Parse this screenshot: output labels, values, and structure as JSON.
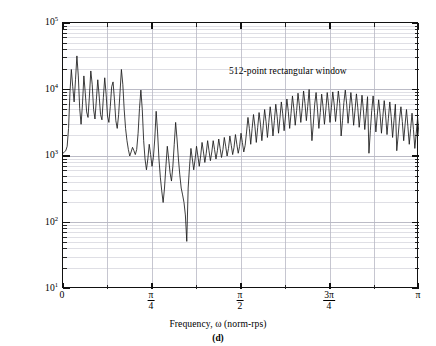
{
  "chart_data": {
    "type": "line",
    "title": "",
    "subcaption": "(d)",
    "annotation": "512-point rectangular window",
    "xlabel": "Frequency, ω  (norm-rps)",
    "ylabel": "Short-term magnitude spectrum, |S(ω;2012)|",
    "xscale": "linear",
    "yscale": "log",
    "xlim": [
      0,
      3.141592653589793
    ],
    "ylim": [
      10,
      100000
    ],
    "grid": "major-and-minor",
    "legend": "none",
    "line_color": "#1a1a1a",
    "grid_color": "#c8c8d0",
    "axis_color": "#111111",
    "xticks": [
      {
        "value": 0,
        "label_num": "0",
        "label_den": ""
      },
      {
        "value": 0.785398,
        "label_num": "π",
        "label_den": "4"
      },
      {
        "value": 1.570796,
        "label_num": "π",
        "label_den": "2"
      },
      {
        "value": 2.356194,
        "label_num": "3π",
        "label_den": "4"
      },
      {
        "value": 3.141593,
        "label_num": "π",
        "label_den": ""
      }
    ],
    "yticks": [
      {
        "value": 100000,
        "mantissa": "10",
        "exponent": "5"
      },
      {
        "value": 10000,
        "mantissa": "10",
        "exponent": "4"
      },
      {
        "value": 1000,
        "mantissa": "10",
        "exponent": "3"
      },
      {
        "value": 100,
        "mantissa": "10",
        "exponent": "2"
      },
      {
        "value": 10,
        "mantissa": "10",
        "exponent": "1"
      }
    ],
    "x": [
      0,
      0.0123,
      0.0245,
      0.0368,
      0.0491,
      0.0614,
      0.0736,
      0.0859,
      0.0982,
      0.1104,
      0.1227,
      0.135,
      0.1473,
      0.1595,
      0.1718,
      0.1841,
      0.1963,
      0.2086,
      0.2209,
      0.2332,
      0.2454,
      0.2577,
      0.27,
      0.2822,
      0.2945,
      0.3068,
      0.3191,
      0.3313,
      0.3436,
      0.3559,
      0.3682,
      0.3804,
      0.3927,
      0.405,
      0.4172,
      0.4295,
      0.4418,
      0.4541,
      0.4663,
      0.4786,
      0.4909,
      0.5031,
      0.5154,
      0.5277,
      0.54,
      0.5522,
      0.5645,
      0.5768,
      0.589,
      0.6013,
      0.6136,
      0.6259,
      0.6381,
      0.6504,
      0.6627,
      0.675,
      0.6872,
      0.6995,
      0.7118,
      0.724,
      0.7363,
      0.7486,
      0.7609,
      0.7731,
      0.7854,
      0.7977,
      0.8099,
      0.8222,
      0.8345,
      0.8468,
      0.859,
      0.8713,
      0.8836,
      0.8958,
      0.9081,
      0.9204,
      0.9327,
      0.9449,
      0.9572,
      0.9695,
      0.9817,
      0.994,
      1.0063,
      1.0186,
      1.0308,
      1.0431,
      1.0554,
      1.0677,
      1.0799,
      1.0922,
      1.1045,
      1.1167,
      1.129,
      1.1413,
      1.1536,
      1.1658,
      1.1781,
      1.1904,
      1.2026,
      1.2149,
      1.2272,
      1.2395,
      1.2517,
      1.264,
      1.2763,
      1.2885,
      1.3008,
      1.3131,
      1.3254,
      1.3376,
      1.3499,
      1.3622,
      1.3744,
      1.3867,
      1.399,
      1.4113,
      1.4235,
      1.4358,
      1.4481,
      1.4604,
      1.4726,
      1.4849,
      1.4972,
      1.5094,
      1.5217,
      1.534,
      1.5463,
      1.5585,
      1.5708,
      1.5831,
      1.5953,
      1.6076,
      1.6199,
      1.6322,
      1.6444,
      1.6567,
      1.669,
      1.6812,
      1.6935,
      1.7058,
      1.7181,
      1.7303,
      1.7426,
      1.7549,
      1.7671,
      1.7794,
      1.7917,
      1.804,
      1.8162,
      1.8285,
      1.8408,
      1.853,
      1.8653,
      1.8776,
      1.8899,
      1.9021,
      1.9144,
      1.9267,
      1.939,
      1.9512,
      1.9635,
      1.9758,
      1.988,
      2.0003,
      2.0126,
      2.0249,
      2.0371,
      2.0494,
      2.0617,
      2.0739,
      2.0862,
      2.0985,
      2.1108,
      2.123,
      2.1353,
      2.1476,
      2.1598,
      2.1721,
      2.1844,
      2.1967,
      2.2089,
      2.2212,
      2.2335,
      2.2458,
      2.258,
      2.2703,
      2.2826,
      2.2948,
      2.3071,
      2.3194,
      2.3317,
      2.3439,
      2.3562,
      2.3685,
      2.3807,
      2.393,
      2.4053,
      2.4176,
      2.4298,
      2.4421,
      2.4544,
      2.4666,
      2.4789,
      2.4912,
      2.5035,
      2.5157,
      2.528,
      2.5403,
      2.5525,
      2.5648,
      2.5771,
      2.5894,
      2.6016,
      2.6139,
      2.6262,
      2.6385,
      2.6507,
      2.663,
      2.6753,
      2.6875,
      2.6998,
      2.7121,
      2.7244,
      2.7366,
      2.7489,
      2.7612,
      2.7734,
      2.7857,
      2.798,
      2.8103,
      2.8225,
      2.8348,
      2.8471,
      2.8593,
      2.8716,
      2.8839,
      2.8962,
      2.9084,
      2.9207,
      2.933,
      2.9452,
      2.9575,
      2.9698,
      2.9821,
      2.9943,
      3.0066,
      3.0189,
      3.0312,
      3.0434,
      3.0557,
      3.068,
      3.0802,
      3.0925,
      3.1048,
      3.1171,
      3.1293,
      3.1416
    ],
    "y": [
      1100,
      1150,
      1200,
      1400,
      2600,
      9000,
      20000,
      11000,
      6500,
      14000,
      32000,
      16000,
      5200,
      3000,
      6000,
      16000,
      9000,
      4600,
      3800,
      8000,
      19000,
      12000,
      5000,
      3600,
      7000,
      14000,
      8000,
      4200,
      3500,
      7500,
      15000,
      8500,
      4000,
      3200,
      5500,
      11000,
      13000,
      7000,
      3400,
      2600,
      4200,
      9000,
      20000,
      12000,
      5000,
      2600,
      1700,
      1250,
      1000,
      1150,
      1350,
      1200,
      1050,
      1250,
      2200,
      5200,
      9800,
      5000,
      1700,
      900,
      620,
      900,
      1500,
      1050,
      700,
      950,
      1800,
      4700,
      2300,
      900,
      480,
      300,
      200,
      330,
      700,
      1400,
      900,
      560,
      420,
      700,
      1500,
      3200,
      1800,
      900,
      520,
      330,
      260,
      200,
      130,
      52,
      330,
      700,
      1300,
      900,
      620,
      900,
      1400,
      1000,
      700,
      1000,
      1600,
      1150,
      800,
      1100,
      1700,
      1200,
      850,
      1150,
      1700,
      1250,
      900,
      1200,
      1800,
      1300,
      950,
      1250,
      1900,
      1400,
      1000,
      1300,
      2000,
      1450,
      1050,
      1350,
      2100,
      1500,
      1100,
      1400,
      2200,
      1600,
      1150,
      1450,
      2300,
      3800,
      2600,
      1500,
      2600,
      4200,
      2800,
      1600,
      2700,
      4500,
      3000,
      1700,
      2900,
      5000,
      3300,
      1900,
      3200,
      5500,
      3600,
      2000,
      3400,
      6000,
      3900,
      2200,
      3700,
      6500,
      4300,
      2400,
      4000,
      7200,
      4700,
      2600,
      4400,
      8000,
      5200,
      2900,
      4800,
      8800,
      5700,
      3200,
      5200,
      9500,
      6200,
      3400,
      5600,
      10000,
      4200,
      1700,
      3000,
      6000,
      9000,
      5000,
      2600,
      4500,
      8500,
      5500,
      3000,
      5000,
      9000,
      5800,
      3200,
      5300,
      9200,
      6000,
      3300,
      5500,
      9500,
      6200,
      2000,
      3400,
      6400,
      9800,
      6000,
      3100,
      5200,
      9000,
      5600,
      2900,
      4900,
      8600,
      5300,
      2700,
      4600,
      8200,
      5000,
      2500,
      4300,
      7800,
      1100,
      2400,
      4800,
      8000,
      4500,
      2300,
      4100,
      7000,
      4300,
      2200,
      3900,
      6800,
      4100,
      2100,
      3700,
      6500,
      3900,
      1900,
      3400,
      6000,
      1200,
      2000,
      3600,
      5500,
      3300,
      1700,
      3000,
      5000,
      2800,
      1500,
      2600,
      4400,
      2500,
      1300,
      2200,
      3800,
      2100,
      1100,
      1900,
      3200,
      1800,
      950,
      1600,
      2800,
      1500,
      800,
      1400,
      2400,
      1300,
      700,
      1200,
      2000,
      1100,
      600,
      1000,
      1700,
      950,
      520,
      900,
      1500,
      850,
      450,
      800,
      1300,
      720,
      400,
      700,
      1150,
      650,
      350,
      600,
      1000,
      560,
      300,
      520,
      900,
      480,
      260,
      450,
      800,
      420,
      230,
      400,
      700,
      380,
      200,
      350,
      620,
      330,
      180,
      310,
      550,
      290,
      160,
      280,
      480,
      260,
      140,
      250,
      430,
      240,
      130,
      220,
      380,
      210,
      115,
      200,
      340,
      190,
      100,
      180,
      300,
      170,
      32,
      160,
      260,
      150,
      85,
      140,
      230,
      130,
      75,
      125,
      210,
      120,
      70,
      115,
      190,
      110,
      65,
      105,
      175,
      100,
      60,
      100,
      160,
      95,
      55,
      90,
      150,
      420,
      900,
      700,
      300,
      150,
      420,
      1100,
      1500,
      900,
      350,
      160,
      90,
      60,
      180,
      520,
      1100,
      700,
      280,
      130,
      70,
      45,
      120,
      400,
      900,
      520,
      200,
      95,
      50,
      25,
      70,
      260,
      700,
      400,
      160,
      80,
      40,
      18,
      60,
      220,
      600,
      350,
      140,
      200,
      420,
      180
    ]
  }
}
